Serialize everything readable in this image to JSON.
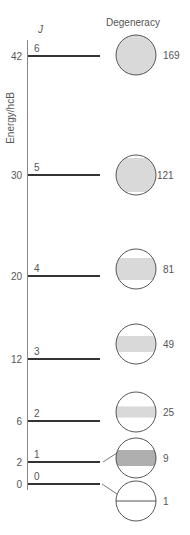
{
  "header": {
    "j_label": "J",
    "degeneracy_label": "Degeneracy",
    "axis_label": "Energy/hcB"
  },
  "colors": {
    "line": "#333333",
    "axis": "#888888",
    "fill": "#d9d9d9",
    "stripe": "#7a7a7a",
    "circle_stroke": "#444444"
  },
  "levels": [
    {
      "J": "0",
      "energy": "0",
      "degeneracy": "1",
      "y": 484,
      "cy": 501,
      "fill_frac": 0
    },
    {
      "J": "1",
      "energy": "2",
      "degeneracy": "9",
      "y": 462,
      "cy": 458,
      "fill_frac": 0.4
    },
    {
      "J": "2",
      "energy": "6",
      "degeneracy": "25",
      "y": 421,
      "cy": 412,
      "fill_frac": 0.28
    },
    {
      "J": "3",
      "energy": "12",
      "degeneracy": "49",
      "y": 359,
      "cy": 344,
      "fill_frac": 0.4
    },
    {
      "J": "4",
      "energy": "20",
      "degeneracy": "81",
      "y": 276,
      "cy": 269,
      "fill_frac": 0.55
    },
    {
      "J": "5",
      "energy": "30",
      "degeneracy": "121",
      "y": 175,
      "cy": 175,
      "fill_frac": 0.85
    },
    {
      "J": "6",
      "energy": "42",
      "degeneracy": "169",
      "y": 56,
      "cy": 55,
      "fill_frac": 1
    }
  ]
}
